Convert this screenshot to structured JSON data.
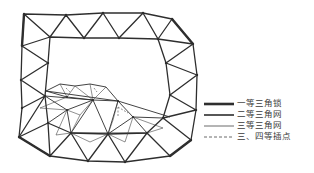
{
  "diagram": {
    "title": "",
    "line_color": "#2e2e2e",
    "background": "#ffffff",
    "outer_ring": [
      [
        24,
        14
      ],
      [
        66,
        15
      ],
      [
        103,
        13
      ],
      [
        143,
        13
      ],
      [
        172,
        19
      ],
      [
        193,
        44
      ],
      [
        197,
        75
      ],
      [
        196,
        110
      ],
      [
        191,
        140
      ],
      [
        170,
        156
      ],
      [
        125,
        162
      ],
      [
        88,
        161
      ],
      [
        50,
        156
      ],
      [
        19,
        137
      ],
      [
        22,
        108
      ],
      [
        21,
        80
      ],
      [
        22,
        46
      ]
    ],
    "inner_ring": [
      [
        50,
        37
      ],
      [
        84,
        38
      ],
      [
        119,
        38
      ],
      [
        158,
        39
      ],
      [
        166,
        63
      ],
      [
        170,
        95
      ],
      [
        163,
        118
      ],
      [
        147,
        133
      ],
      [
        108,
        134
      ],
      [
        71,
        133
      ],
      [
        48,
        123
      ],
      [
        45,
        96
      ],
      [
        48,
        63
      ]
    ],
    "second_order_nodes": [
      [
        46,
        91
      ],
      [
        67,
        97
      ],
      [
        93,
        100
      ],
      [
        118,
        101
      ],
      [
        133,
        117
      ],
      [
        92,
        84
      ],
      [
        65,
        110
      ]
    ]
  },
  "legend": {
    "items": [
      {
        "label": "一等三角锁",
        "style": "thick"
      },
      {
        "label": "二等三角网",
        "style": "medium"
      },
      {
        "label": "三等三角网",
        "style": "thin"
      },
      {
        "label": "三、四等插点",
        "style": "dashed"
      }
    ]
  }
}
